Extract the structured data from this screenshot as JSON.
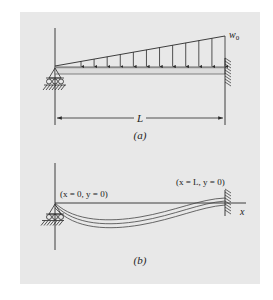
{
  "figure": {
    "panel_a": {
      "caption": "(a)",
      "load_label": "w",
      "load_label_sub": "0",
      "span_label": "L",
      "arrow_count": 12
    },
    "panel_b": {
      "caption": "(b)",
      "left_bc_label": "(x = 0, y = 0)",
      "right_bc_label": "(x = L, y = 0)",
      "axis_label_x": "x"
    },
    "colors": {
      "background": "#e8e8e8",
      "line": "#2a2a2a",
      "beam": "#555555"
    }
  }
}
